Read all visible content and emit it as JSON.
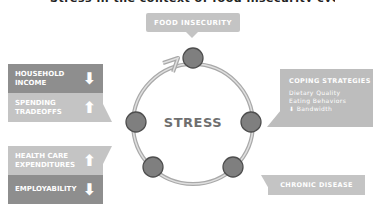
{
  "title_cut": "Stress in the context of food insecurity cycle",
  "center_label": "STRESS",
  "top_box": {
    "label": "FOOD INSECURITY"
  },
  "left_top_group": {
    "rows": [
      {
        "label_line1": "HOUSEHOLD",
        "label_line2": "INCOME",
        "arrow": "down",
        "arrow_glyph": "⬇",
        "color": "#8e8e8e"
      },
      {
        "label_line1": "SPENDING",
        "label_line2": "TRADEOFFS",
        "arrow": "up",
        "arrow_glyph": "⬆",
        "color": "#c4c4c4"
      }
    ]
  },
  "left_bottom_group": {
    "rows": [
      {
        "label_line1": "HEALTH CARE",
        "label_line2": "EXPENDITURES",
        "arrow": "up",
        "arrow_glyph": "⬆",
        "color": "#c4c4c4"
      },
      {
        "label_line1": "EMPLOYABILITY",
        "label_line2": "",
        "arrow": "down",
        "arrow_glyph": "⬇",
        "color": "#8e8e8e"
      }
    ]
  },
  "coping_box": {
    "heading": "COPING STRATEGIES",
    "items": [
      "Dietary Quality",
      "Eating Behaviors",
      "⬇ Bandwidth"
    ]
  },
  "chronic_box": {
    "label": "CHRONIC DISEASE"
  },
  "colors": {
    "node": "#7f7f7f",
    "node_stroke": "#555555",
    "ring": "#b5b5b5",
    "box_light": "#c4c4c4",
    "box_dark": "#8e8e8e"
  }
}
